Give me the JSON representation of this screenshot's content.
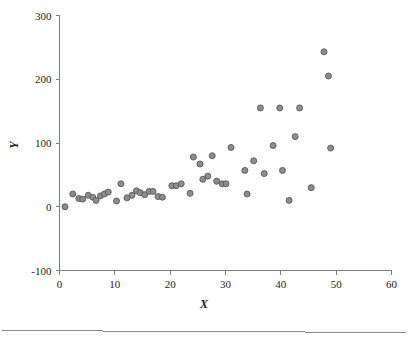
{
  "chart_data": {
    "type": "scatter",
    "title": "",
    "xlabel": "X",
    "ylabel": "Y",
    "xlim": [
      0,
      60
    ],
    "ylim": [
      -100,
      300
    ],
    "xticks": [
      0,
      10,
      20,
      30,
      40,
      50,
      60
    ],
    "yticks": [
      -100,
      0,
      100,
      200,
      300
    ],
    "xtick_labels": [
      "0",
      "10",
      "20",
      "30",
      "40",
      "50",
      "60"
    ],
    "ytick_labels": [
      "-100",
      "0",
      "100",
      "200",
      "300"
    ],
    "grid": false,
    "legend": null,
    "marker": {
      "shape": "circle",
      "fill_color": "#8d8d91",
      "edge_color": "#58585b",
      "size_px": 6
    },
    "axis_color": "#7f7f7f",
    "points": [
      {
        "x": 1.0,
        "y": 0
      },
      {
        "x": 2.4,
        "y": 20
      },
      {
        "x": 3.5,
        "y": 13
      },
      {
        "x": 4.2,
        "y": 12
      },
      {
        "x": 5.2,
        "y": 18
      },
      {
        "x": 6.0,
        "y": 15
      },
      {
        "x": 6.6,
        "y": 10
      },
      {
        "x": 7.4,
        "y": 17
      },
      {
        "x": 8.1,
        "y": 20
      },
      {
        "x": 8.8,
        "y": 23
      },
      {
        "x": 10.3,
        "y": 9
      },
      {
        "x": 11.1,
        "y": 36
      },
      {
        "x": 12.2,
        "y": 14
      },
      {
        "x": 13.1,
        "y": 18
      },
      {
        "x": 13.9,
        "y": 25
      },
      {
        "x": 14.6,
        "y": 22
      },
      {
        "x": 15.4,
        "y": 19
      },
      {
        "x": 16.2,
        "y": 24
      },
      {
        "x": 16.9,
        "y": 24
      },
      {
        "x": 17.8,
        "y": 16
      },
      {
        "x": 18.6,
        "y": 15
      },
      {
        "x": 20.3,
        "y": 33
      },
      {
        "x": 21.1,
        "y": 33
      },
      {
        "x": 22.0,
        "y": 36
      },
      {
        "x": 23.6,
        "y": 21
      },
      {
        "x": 24.2,
        "y": 78
      },
      {
        "x": 25.4,
        "y": 67
      },
      {
        "x": 25.9,
        "y": 43
      },
      {
        "x": 26.8,
        "y": 48
      },
      {
        "x": 27.6,
        "y": 80
      },
      {
        "x": 28.4,
        "y": 40
      },
      {
        "x": 29.4,
        "y": 36
      },
      {
        "x": 30.1,
        "y": 36
      },
      {
        "x": 31.0,
        "y": 93
      },
      {
        "x": 33.5,
        "y": 57
      },
      {
        "x": 33.9,
        "y": 20
      },
      {
        "x": 35.1,
        "y": 72
      },
      {
        "x": 36.3,
        "y": 155
      },
      {
        "x": 37.0,
        "y": 52
      },
      {
        "x": 38.6,
        "y": 96
      },
      {
        "x": 39.8,
        "y": 155
      },
      {
        "x": 40.3,
        "y": 57
      },
      {
        "x": 41.5,
        "y": 10
      },
      {
        "x": 42.6,
        "y": 110
      },
      {
        "x": 43.4,
        "y": 155
      },
      {
        "x": 45.5,
        "y": 30
      },
      {
        "x": 47.8,
        "y": 243
      },
      {
        "x": 48.6,
        "y": 205
      },
      {
        "x": 49.0,
        "y": 92
      }
    ]
  }
}
